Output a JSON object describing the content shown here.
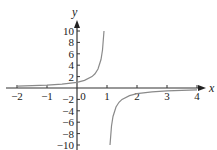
{
  "chart_data": {
    "type": "line",
    "title": "",
    "xlabel": "x",
    "ylabel": "y",
    "xlim": [
      -2,
      4
    ],
    "ylim": [
      -10,
      10
    ],
    "x_ticks": [
      -2,
      -1,
      0,
      1,
      2,
      3,
      4
    ],
    "x_tick_labels": [
      "−2",
      "−1",
      "0",
      "1",
      "2",
      "3",
      "4"
    ],
    "y_ticks": [
      -10,
      -8,
      -6,
      -4,
      -2,
      2,
      4,
      6,
      8,
      10
    ],
    "y_tick_labels": [
      "−10",
      "−8",
      "−6",
      "−4",
      "−2",
      "2",
      "4",
      "6",
      "8",
      "10"
    ],
    "grid": false,
    "legend": "none",
    "series": [
      {
        "name": "y = 1/(1 − x)",
        "description": "Hyperbola with vertical asymptote at x = 1 and horizontal asymptote y = 0",
        "branches": [
          {
            "x": [
              -2,
              -1.5,
              -1,
              -0.5,
              0,
              0.25,
              0.5,
              0.6,
              0.7,
              0.8,
              0.85,
              0.9
            ],
            "y": [
              0.333,
              0.4,
              0.5,
              0.667,
              1,
              1.333,
              2,
              2.5,
              3.333,
              5,
              6.667,
              10
            ]
          },
          {
            "x": [
              1.1,
              1.15,
              1.2,
              1.3,
              1.4,
              1.5,
              1.75,
              2,
              2.5,
              3,
              3.5,
              4
            ],
            "y": [
              -10,
              -6.667,
              -5,
              -3.333,
              -2.5,
              -2,
              -1.333,
              -1,
              -0.667,
              -0.5,
              -0.4,
              -0.333
            ]
          }
        ]
      }
    ]
  }
}
